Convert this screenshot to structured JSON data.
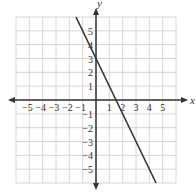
{
  "figure_label": "",
  "axes": {
    "x_label": "x",
    "y_label": "y",
    "x_range": [
      -6,
      6
    ],
    "y_range": [
      -6,
      6
    ],
    "x_ticks": [
      "−5",
      "−4",
      "−3",
      "−2",
      "−1",
      "1",
      "2",
      "3",
      "4",
      "5"
    ],
    "x_tick_values": [
      -5,
      -4,
      -3,
      -2,
      -1,
      1,
      2,
      3,
      4,
      5
    ],
    "y_ticks": [
      "5",
      "4",
      "3",
      "2",
      "1",
      "−1",
      "−2",
      "−3",
      "−4",
      "−5"
    ],
    "y_tick_values": [
      5,
      4,
      3,
      2,
      1,
      -1,
      -2,
      -3,
      -4,
      -5
    ]
  },
  "line": {
    "equation": "y = -2x + 3",
    "slope": -2,
    "intercept": 3,
    "from": [
      -1.5,
      6
    ],
    "to": [
      4.5,
      -6
    ],
    "color": "#333333"
  },
  "colors": {
    "grid": "#cccccc",
    "axis": "#333333"
  }
}
